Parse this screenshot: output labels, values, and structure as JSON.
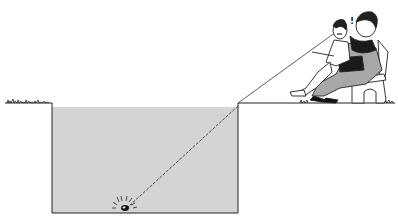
{
  "figure": {
    "exclamation": "!",
    "colors": {
      "water": "#d4d4d4",
      "ink": "#222222",
      "background": "#ffffff",
      "dress": "#a8a8a8",
      "shawl": "#1a1a1a"
    },
    "elements": {
      "ground_left": "ground-left",
      "ground_right": "ground-right",
      "pool": "pool-of-water",
      "coin": "coin-on-bottom",
      "sight_line": "line-of-sight",
      "man": "seated-man",
      "woman": "seated-woman",
      "bench": "bench"
    }
  }
}
